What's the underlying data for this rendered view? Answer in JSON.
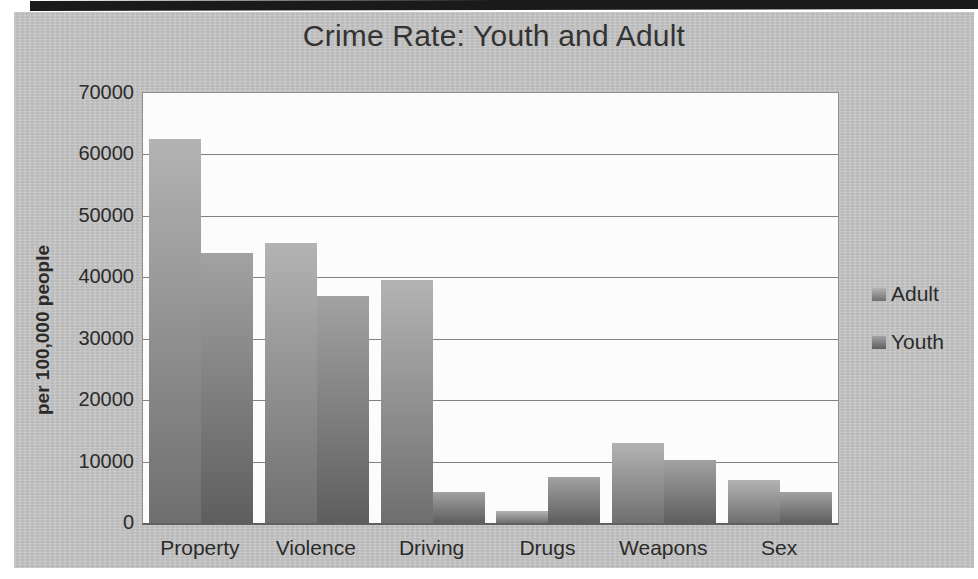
{
  "scan": {
    "page_background": "#ffffff",
    "top_strip_color": "#1a1a1a"
  },
  "chart": {
    "surface_color": "#c7c7c7",
    "plot_background": "#fcfcfc",
    "gridline_color": "#808080",
    "axis_line_color": "#606060",
    "text_color": "#2b2b2b",
    "title_color": "#333333",
    "series_styles": [
      {
        "name": "Adult",
        "gradient_top": "#b3b3b3",
        "gradient_bottom": "#6f6f6f"
      },
      {
        "name": "Youth",
        "gradient_top": "#a2a2a2",
        "gradient_bottom": "#5e5e5e"
      }
    ]
  },
  "chart_data": {
    "type": "bar",
    "title": "Crime Rate: Youth and Adult",
    "categories": [
      "Property",
      "Violence",
      "Driving",
      "Drugs",
      "Weapons",
      "Sex"
    ],
    "series": [
      {
        "name": "Adult",
        "values": [
          62500,
          45500,
          39500,
          2000,
          13000,
          7000
        ]
      },
      {
        "name": "Youth",
        "values": [
          44000,
          37000,
          5000,
          7500,
          10300,
          5000
        ]
      }
    ],
    "xlabel": "",
    "ylabel": "per 100,000 people",
    "ylim": [
      0,
      70000
    ],
    "yticks": [
      0,
      10000,
      20000,
      30000,
      40000,
      50000,
      60000,
      70000
    ],
    "grid": true,
    "legend_position": "right",
    "legend_labels": [
      "Adult",
      "Youth"
    ]
  }
}
